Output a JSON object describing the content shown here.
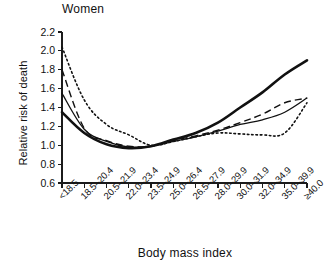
{
  "chart_data": {
    "type": "line",
    "title": "Women",
    "subtitle": "",
    "xlabel": "Body mass index",
    "ylabel": "Relative risk of death",
    "categories": [
      "<18.5",
      "18.5–20.4",
      "20.5–21.9",
      "22.0–23.4",
      "23.5–24.9",
      "25.0–26.4",
      "26.5–27.9",
      "28.0–29.9",
      "30.0–31.9",
      "32.0–34.9",
      "35.0–39.9",
      "≥40.0"
    ],
    "ylim": [
      0.6,
      2.2
    ],
    "ytick_labels": [
      "0.6",
      "0.8",
      "1.0",
      "1.2",
      "1.4",
      "1.6",
      "1.8",
      "2.0",
      "2.2"
    ],
    "ytick_values": [
      0.6,
      0.8,
      1.0,
      1.2,
      1.4,
      1.6,
      1.8,
      2.0,
      2.2
    ],
    "ystep": 0.2,
    "grid": false,
    "legend": "none",
    "legend_position": "none",
    "line_color": "#111111",
    "series": [
      {
        "name": "thick-solid",
        "style": "solid-thick",
        "values": [
          1.35,
          1.13,
          1.01,
          0.97,
          0.99,
          1.06,
          1.13,
          1.24,
          1.4,
          1.56,
          1.75,
          1.9
        ]
      },
      {
        "name": "thin-solid",
        "style": "solid-thin",
        "values": [
          1.55,
          1.17,
          1.04,
          0.98,
          0.99,
          1.04,
          1.09,
          1.15,
          1.22,
          1.27,
          1.35,
          1.5
        ]
      },
      {
        "name": "dashed",
        "style": "dashed",
        "values": [
          1.8,
          1.18,
          1.05,
          0.99,
          0.99,
          1.05,
          1.1,
          1.16,
          1.24,
          1.33,
          1.45,
          1.5
        ]
      },
      {
        "name": "dotted",
        "style": "dotted",
        "values": [
          2.04,
          1.48,
          1.22,
          1.11,
          1.0,
          1.04,
          1.09,
          1.13,
          1.12,
          1.11,
          1.13,
          1.45
        ]
      }
    ],
    "axes": {
      "x_px": [
        62,
        307
      ],
      "y_px": [
        183,
        32
      ]
    }
  }
}
